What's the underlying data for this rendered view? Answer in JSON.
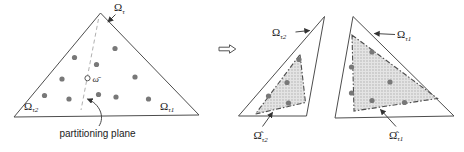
{
  "colors": {
    "line": "#4d4d4d",
    "dashed_partition_line": "#b0b0b0",
    "particle": "#787878",
    "hull_fill": "#e4e4e4",
    "hull_stipple": "#a9a9a9",
    "text": "#1a1a1a"
  },
  "left_diagram": {
    "parent_label": {
      "base": "Ω",
      "sub": "τ"
    },
    "left_child_label": {
      "base": "Ω",
      "sub": "τ2"
    },
    "right_child_label": {
      "base": "Ω",
      "sub": "τ1"
    },
    "centroid_label": "ω̄",
    "annotation": "partitioning plane",
    "particles": [
      [
        74.5,
        57.5
      ],
      [
        115,
        48.5
      ],
      [
        96.5,
        64.5
      ],
      [
        62,
        79
      ],
      [
        135,
        77
      ],
      [
        44.5,
        95.5
      ],
      [
        69,
        99
      ],
      [
        98.5,
        94.5
      ],
      [
        116,
        97
      ],
      [
        148.5,
        99
      ]
    ]
  },
  "transform": {
    "icon": "double-right-arrow"
  },
  "middle_diagram": {
    "outer_label": {
      "base": "Ω",
      "sub": "τ2"
    },
    "hull_label": {
      "base": "Ω̂",
      "sub": "τ2"
    },
    "particles": [
      [
        299,
        59.5
      ],
      [
        287,
        82.5
      ],
      [
        268.5,
        96
      ],
      [
        288.5,
        103
      ]
    ]
  },
  "right_diagram": {
    "outer_label": {
      "base": "Ω",
      "sub": "τ1"
    },
    "hull_label": {
      "base": "Ω̂",
      "sub": "τ1"
    },
    "particles": [
      [
        372,
        52
      ],
      [
        351.5,
        67
      ],
      [
        390,
        82
      ],
      [
        351.5,
        93
      ],
      [
        372,
        100.5
      ],
      [
        404.5,
        102.5
      ]
    ]
  }
}
